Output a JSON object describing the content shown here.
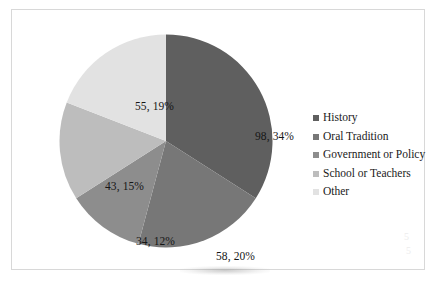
{
  "chart_data": {
    "type": "pie",
    "title": "",
    "subtitle": "",
    "xlabel": "",
    "ylabel": "",
    "total": 288,
    "start_angle_deg": 0,
    "direction": "clockwise",
    "grid": false,
    "legend_position": "right",
    "categories": [
      "History",
      "Oral Tradition",
      "Government or Policy",
      "School or Teachers",
      "Other"
    ],
    "values": [
      98,
      58,
      34,
      43,
      55
    ],
    "percents": [
      34,
      20,
      12,
      15,
      19
    ],
    "colors": [
      "#5f5f5f",
      "#777777",
      "#8d8d8d",
      "#bdbdbd",
      "#e2e2e2"
    ],
    "data_labels": [
      "98, 34%",
      "58, 20%",
      "34, 12%",
      "43, 15%",
      "55, 19%"
    ],
    "slices": [
      {
        "label": "History",
        "value": 98,
        "percent": 34,
        "data_label": "98, 34%",
        "color": "#5f5f5f"
      },
      {
        "label": "Oral Tradition",
        "value": 58,
        "percent": 20,
        "data_label": "58, 20%",
        "color": "#777777"
      },
      {
        "label": "Government or Policy",
        "value": 34,
        "percent": 12,
        "data_label": "34, 12%",
        "color": "#8d8d8d"
      },
      {
        "label": "School or Teachers",
        "value": 43,
        "percent": 15,
        "data_label": "43, 15%",
        "color": "#bdbdbd"
      },
      {
        "label": "Other",
        "value": 55,
        "percent": 19,
        "data_label": "55, 19%",
        "color": "#e2e2e2"
      }
    ]
  },
  "legend": {
    "items": [
      {
        "label": "History",
        "marker": "square-swatch-icon",
        "color": "#5f5f5f"
      },
      {
        "label": "Oral Tradition",
        "marker": "square-swatch-icon",
        "color": "#777777"
      },
      {
        "label": "Government or Policy",
        "marker": "square-swatch-icon",
        "color": "#8d8d8d"
      },
      {
        "label": "School or Teachers",
        "marker": "square-swatch-icon",
        "color": "#bdbdbd"
      },
      {
        "label": "Other",
        "marker": "square-swatch-icon",
        "color": "#e2e2e2"
      }
    ]
  },
  "page": {
    "background": "#ffffff",
    "frame_color": "#d8d8d8",
    "caption_remnant": "",
    "smudge_a": "5",
    "smudge_b": "5"
  }
}
